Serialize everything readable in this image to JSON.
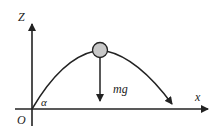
{
  "diagram": {
    "axes": {
      "vertical_label": "Z",
      "horizontal_label": "x",
      "origin_label": "O"
    },
    "angle_label": "α",
    "force_label": "mg",
    "colors": {
      "line": "#222222",
      "ball_fill": "#c8c8c8",
      "background": "#ffffff"
    }
  }
}
